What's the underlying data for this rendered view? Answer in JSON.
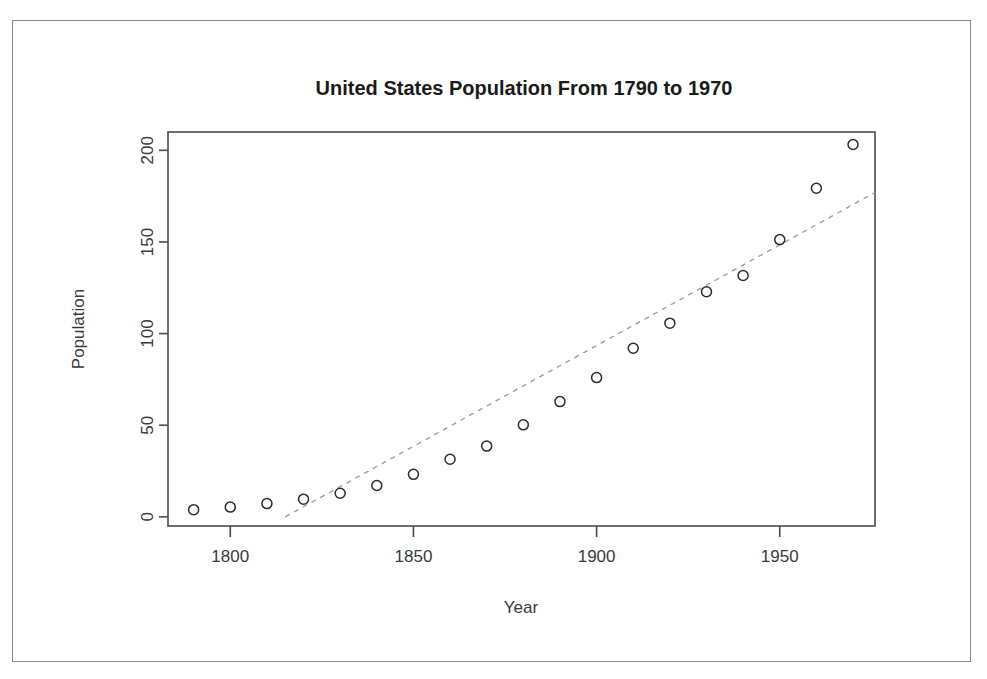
{
  "chart_data": {
    "type": "scatter",
    "title": "United States Population From 1790 to 1970",
    "xlabel": "Year",
    "ylabel": "Population",
    "x": [
      1790,
      1800,
      1810,
      1820,
      1830,
      1840,
      1850,
      1860,
      1870,
      1880,
      1890,
      1900,
      1910,
      1920,
      1930,
      1940,
      1950,
      1960,
      1970
    ],
    "values": [
      3.93,
      5.31,
      7.24,
      9.64,
      12.9,
      17.1,
      23.2,
      31.4,
      38.6,
      50.2,
      62.9,
      76.0,
      92.0,
      105.7,
      122.8,
      131.7,
      151.3,
      179.3,
      203.2
    ],
    "series": [
      {
        "name": "Population",
        "marker": "open-circle",
        "values": [
          3.93,
          5.31,
          7.24,
          9.64,
          12.9,
          17.1,
          23.2,
          31.4,
          38.6,
          50.2,
          62.9,
          76.0,
          92.0,
          105.7,
          122.8,
          131.7,
          151.3,
          179.3,
          203.2
        ]
      },
      {
        "name": "linear-fit",
        "style": "dashed",
        "x_endpoints": [
          1815,
          1976
        ],
        "y_endpoints": [
          0,
          177
        ]
      }
    ],
    "xlim": [
      1783,
      1976
    ],
    "ylim": [
      -5,
      210
    ],
    "xticks": [
      1800,
      1850,
      1900,
      1950
    ],
    "xtick_labels": [
      "1800",
      "1850",
      "1900",
      "1950"
    ],
    "yticks": [
      0,
      50,
      100,
      150,
      200
    ],
    "ytick_labels": [
      "0",
      "50",
      "100",
      "150",
      "200"
    ],
    "grid": false,
    "legend": "none",
    "colors": {
      "marker": "#2b2b2b",
      "fit_line": "#9a9a9a",
      "axis": "#4a4a4a",
      "text": "#3a3a3a",
      "title": "#1a1a1a",
      "background": "#ffffff",
      "page_frame": "#8a8a8a"
    }
  }
}
